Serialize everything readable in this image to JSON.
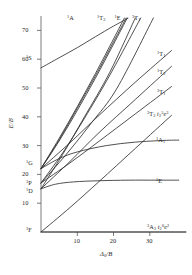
{
  "figure": {
    "kind": "tanabe-sugano-diagram",
    "background": "#ffffff",
    "line_color": "#303030"
  },
  "axes": {
    "y_title": "E/B",
    "x_title": "Δ₀/B",
    "x_title_base": "Δ",
    "x_title_sub": "0",
    "x_title_den": "/B",
    "y_ticks": [
      "10",
      "20",
      "30",
      "40",
      "50",
      "60",
      "70"
    ],
    "x_ticks": [
      "10",
      "20",
      "30"
    ],
    "x_range": [
      0,
      40
    ],
    "y_range": [
      0,
      75
    ]
  },
  "free_ion_terms": [
    {
      "label": "¹S",
      "sup": "1",
      "term": "S",
      "y": 57.0
    },
    {
      "label": "¹G",
      "sup": "1",
      "term": "G",
      "y": 22.0
    },
    {
      "label": "³P",
      "sup": "3",
      "term": "P",
      "y": 17.0
    },
    {
      "label": "¹D",
      "sup": "1",
      "term": "D",
      "y": 15.0
    },
    {
      "label": "³F",
      "sup": "3",
      "term": "F",
      "y": 0.0
    }
  ],
  "top_labels": [
    {
      "sup": "1",
      "term": "A",
      "sub": ""
    },
    {
      "sup": "1",
      "term": "T",
      "sub": "2"
    },
    {
      "sup": "1",
      "term": "E",
      "sub": ""
    },
    {
      "sup": "3",
      "term": "T",
      "sub": "1"
    }
  ],
  "right_labels": [
    {
      "sup": "1",
      "term": "T",
      "sub": "1"
    },
    {
      "sup": "1",
      "term": "T",
      "sub": "2"
    },
    {
      "sup": "3",
      "term": "T",
      "sub": "1"
    },
    {
      "sup": "3",
      "term": "T",
      "sub": "2"
    },
    {
      "sup": "1",
      "term": "A",
      "sub": "1"
    },
    {
      "sup": "1",
      "term": "E",
      "sub": ""
    }
  ],
  "configurations": {
    "excited": {
      "sup": "3",
      "term": "T",
      "sub": "2",
      "config_base": "t",
      "config_sub": "2",
      "config_sup": "5",
      "config_e": "e",
      "config_e_sup": "3"
    },
    "ground": {
      "sup": "3",
      "term": "A",
      "sub": "2",
      "config_base": "t",
      "config_sub": "2",
      "config_sup": "6",
      "config_e": "e",
      "config_e_sup": "2"
    }
  },
  "chart_data": {
    "type": "line",
    "title": "",
    "xlabel": "Δ₀/B",
    "ylabel": "E/B",
    "xlim": [
      0,
      40
    ],
    "ylim": [
      0,
      75
    ],
    "grid": false,
    "legend": "inline-labels",
    "x_ticks": [
      10,
      20,
      30
    ],
    "y_ticks": [
      10,
      20,
      30,
      40,
      50,
      60,
      70
    ],
    "free_ion_origins": {
      "3F": 0,
      "1D": 15,
      "3P": 17,
      "1G": 22,
      "1S": 57
    },
    "series": [
      {
        "name": "¹A₁ (from ¹S)",
        "label": "¹A",
        "label_pos": "top",
        "x": [
          0,
          5,
          10,
          15,
          20,
          24
        ],
        "y": [
          57,
          60.5,
          64.0,
          67.8,
          71.5,
          74.2
        ]
      },
      {
        "name": "¹T₂ (upper, from ¹G)",
        "label": "¹T₂",
        "label_pos": "top",
        "x": [
          0,
          5,
          10,
          15,
          20,
          23
        ],
        "y": [
          22,
          32.5,
          43.5,
          55.0,
          67.0,
          74.3
        ]
      },
      {
        "name": "¹E (upper, from ¹G)",
        "label": "¹E",
        "label_pos": "top",
        "x": [
          0,
          5,
          10,
          15,
          20,
          23.5
        ],
        "y": [
          22,
          32.0,
          43.0,
          54.2,
          66.0,
          74.3
        ]
      },
      {
        "name": "¹A₁ (upper branch from ¹G)",
        "label": "",
        "label_pos": "none",
        "x": [
          0,
          5,
          10,
          15,
          20,
          23.8
        ],
        "y": [
          22,
          31.6,
          42.2,
          53.4,
          65.2,
          74.3
        ]
      },
      {
        "name": "¹T₂ (second branch)",
        "label": "",
        "label_pos": "none",
        "x": [
          0,
          6,
          12,
          19,
          26
        ],
        "y": [
          15,
          27.0,
          40.0,
          55.5,
          74.3
        ]
      },
      {
        "name": "¹E (second branch)",
        "label": "¹E",
        "label_pos": "top",
        "x": [
          0,
          6,
          12,
          19,
          27.5
        ],
        "y": [
          17,
          27.5,
          39.5,
          54.5,
          74.3
        ]
      },
      {
        "name": "³T₁ (P) steep",
        "label": "³T₁",
        "label_pos": "top",
        "x": [
          0,
          7,
          14,
          21,
          31
        ],
        "y": [
          17,
          27.0,
          38.0,
          50.0,
          74.3
        ]
      },
      {
        "name": "¹T₁ right",
        "label": "¹T₁",
        "label_pos": "right",
        "x": [
          0,
          8,
          16,
          26,
          36
        ],
        "y": [
          22,
          31.0,
          40.5,
          52.0,
          63.0
        ]
      },
      {
        "name": "¹T₂ right",
        "label": "¹T₂",
        "label_pos": "right",
        "x": [
          0,
          8,
          16,
          26,
          36
        ],
        "y": [
          15,
          24.5,
          34.5,
          46.0,
          57.5
        ]
      },
      {
        "name": "³T₁ right",
        "label": "³T₁",
        "label_pos": "right",
        "x": [
          0,
          8,
          16,
          26,
          36
        ],
        "y": [
          17,
          24.0,
          31.5,
          41.0,
          50.5
        ]
      },
      {
        "name": "³T₂ ground-derived",
        "label": "³T₂",
        "label_pos": "right",
        "x": [
          0,
          8,
          16,
          26,
          36
        ],
        "y": [
          0,
          8.5,
          17.5,
          29.0,
          40.5
        ]
      },
      {
        "name": "³A₂ ground state",
        "label": "³A₂",
        "label_pos": "baseline",
        "x": [
          0,
          10,
          20,
          30,
          40
        ],
        "y": [
          0,
          0,
          0,
          0,
          0
        ]
      },
      {
        "name": "¹A₁ saturating",
        "label": "¹A₁",
        "label_pos": "right",
        "x": [
          0,
          5,
          10,
          18,
          26,
          34,
          38
        ],
        "y": [
          22,
          25.5,
          27.8,
          30.0,
          31.2,
          31.8,
          31.9
        ]
      },
      {
        "name": "¹E saturating",
        "label": "¹E",
        "label_pos": "right",
        "x": [
          0,
          4,
          9,
          16,
          24,
          32,
          38
        ],
        "y": [
          15,
          16.6,
          17.4,
          17.8,
          18.0,
          18.0,
          18.0
        ]
      }
    ]
  }
}
